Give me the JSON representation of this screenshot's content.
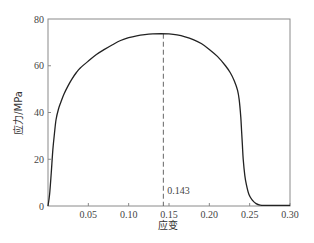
{
  "chart_data": {
    "type": "line",
    "title": "",
    "xlabel": "应变",
    "ylabel": "应力/MPa",
    "xlim": [
      0,
      0.3
    ],
    "ylim": [
      0,
      80
    ],
    "xticks": [
      0.05,
      0.1,
      0.15,
      0.2,
      0.25,
      0.3
    ],
    "xtick_labels": [
      "0.05",
      "0.10",
      "0.15",
      "0.20",
      "0.25",
      "0.30"
    ],
    "yticks": [
      0,
      20,
      40,
      60,
      80
    ],
    "ytick_labels": [
      "0",
      "20",
      "40",
      "60",
      "80"
    ],
    "grid": false,
    "legend": null,
    "series": [
      {
        "name": "stress-strain",
        "color": "#222222",
        "x": [
          0.0,
          0.002,
          0.004,
          0.006,
          0.008,
          0.01,
          0.013,
          0.016,
          0.02,
          0.025,
          0.03,
          0.035,
          0.04,
          0.05,
          0.06,
          0.07,
          0.08,
          0.09,
          0.1,
          0.11,
          0.12,
          0.13,
          0.14,
          0.15,
          0.16,
          0.17,
          0.18,
          0.19,
          0.2,
          0.21,
          0.22,
          0.226,
          0.231,
          0.235,
          0.237,
          0.239,
          0.24,
          0.241,
          0.242,
          0.244,
          0.246,
          0.249,
          0.253,
          0.258,
          0.263,
          0.27,
          0.28,
          0.29,
          0.3
        ],
        "y": [
          0.0,
          5.0,
          14.0,
          24.0,
          31.0,
          37.0,
          41.5,
          44.5,
          48.0,
          51.5,
          54.5,
          57.0,
          59.0,
          62.0,
          64.8,
          67.0,
          69.0,
          70.8,
          72.0,
          72.8,
          73.3,
          73.6,
          73.7,
          73.6,
          73.2,
          72.4,
          71.2,
          69.5,
          67.0,
          64.0,
          60.0,
          57.0,
          53.5,
          49.5,
          45.5,
          38.0,
          32.0,
          26.0,
          20.0,
          13.0,
          9.0,
          5.0,
          2.6,
          1.0,
          0.4,
          0.3,
          0.3,
          0.3,
          0.3
        ]
      }
    ],
    "annotations": [
      {
        "type": "vline",
        "x": 0.143,
        "style": "dashed",
        "color": "#666666",
        "label": "0.143"
      }
    ]
  },
  "frame": {
    "color": "#8a8a8a"
  }
}
